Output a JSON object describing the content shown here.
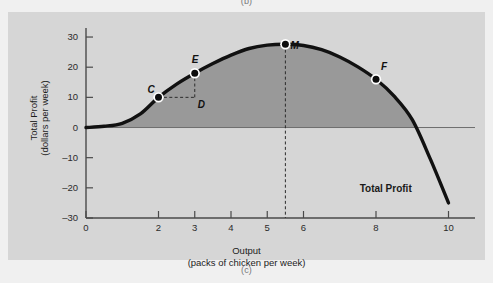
{
  "figure": {
    "caption_top": "(b)",
    "caption_bottom": "(c)",
    "panel_bg": "#d6d6d6",
    "fill_color": "#999999",
    "curve_color": "#111111"
  },
  "chart_data": {
    "type": "line",
    "title": "",
    "xlabel": "Output",
    "xlabel_sub": "(packs of chicken per week)",
    "ylabel": "Total Profit",
    "ylabel_sub": "(dollars per week)",
    "xlim": [
      0,
      10.4
    ],
    "ylim": [
      -30,
      32
    ],
    "grid": false,
    "legend": "none",
    "xticks": [
      0,
      2,
      3,
      4,
      5,
      6,
      8,
      10
    ],
    "xticklabels": [
      "0",
      "2",
      "3",
      "4",
      "5",
      "6",
      "8",
      "10"
    ],
    "yticks": [
      -30,
      -20,
      -10,
      0,
      10,
      20,
      30
    ],
    "yticklabels": [
      "–30",
      "–20",
      "–10",
      "0",
      "10",
      "20",
      "30"
    ],
    "series_name": "Total Profit",
    "series_label_text": "Total Profit",
    "x": [
      0,
      0.5,
      1,
      1.5,
      2,
      2.5,
      3,
      3.5,
      4,
      4.5,
      5,
      5.5,
      6,
      6.5,
      7,
      7.5,
      8,
      8.5,
      9,
      9.5,
      10
    ],
    "y": [
      0,
      0.4,
      1.4,
      4.5,
      10,
      14.4,
      18,
      21.2,
      24,
      26.2,
      27.3,
      27.6,
      27.2,
      25.8,
      23.4,
      20.1,
      16,
      10.4,
      2.6,
      -10.5,
      -25
    ],
    "area_fill_from": 0,
    "annotations": [
      {
        "label": "C",
        "x": 2,
        "y": 10,
        "label_dx": -11,
        "label_dy": -13
      },
      {
        "label": "D",
        "x": 3,
        "y": 10,
        "label_dx": 3,
        "label_dy": 2
      },
      {
        "label": "E",
        "x": 3,
        "y": 18,
        "label_dx": -3,
        "label_dy": -19
      },
      {
        "label": "M",
        "x": 5.5,
        "y": 27.6,
        "label_dx": 5,
        "label_dy": -4
      },
      {
        "label": "F",
        "x": 8,
        "y": 16,
        "label_dx": 5,
        "label_dy": -18
      }
    ],
    "dashed_guides": [
      {
        "name": "c-to-d",
        "from": [
          2,
          10
        ],
        "to": [
          3,
          10
        ]
      },
      {
        "name": "d-to-e",
        "from": [
          3,
          10
        ],
        "to": [
          3,
          18
        ]
      },
      {
        "name": "m-dropline",
        "from": [
          5.5,
          27.6
        ],
        "to": [
          5.5,
          -30
        ]
      }
    ],
    "markers": [
      "C",
      "D",
      "E",
      "M",
      "F"
    ]
  }
}
